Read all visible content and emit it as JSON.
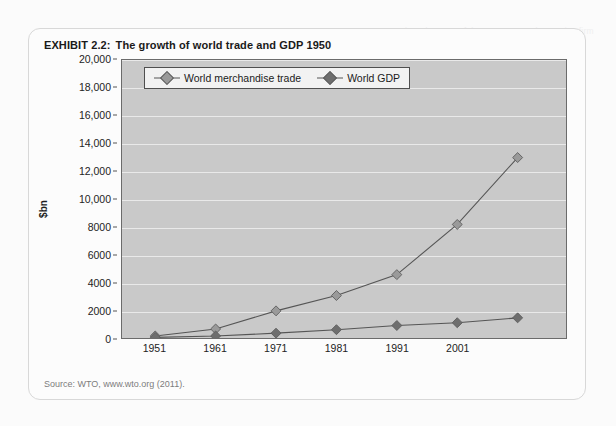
{
  "exhibit": {
    "label": "EXHIBIT 2.2:",
    "title": "The growth of world trade and GDP 1950",
    "source": "Source: WTO, www.wto.org (2011)."
  },
  "bleed_text": "EXHIBIT 2.1  The relevance of the customer to the service firm",
  "colors": {
    "plot_background": "#c9c9c9",
    "plot_border": "#6b6b6b",
    "gridline": "#e9e9e9",
    "trade_series": "#8f8f8f",
    "gdp_series": "#6e6e6e",
    "legend_background": "#f2f2f2",
    "card_border": "#d8d8d8"
  },
  "legend": {
    "position": "top-left-inside-plot",
    "items": [
      {
        "label": "World merchandise trade",
        "marker": "diamond-light",
        "color": "#9a9a9a"
      },
      {
        "label": "World GDP",
        "marker": "diamond-dark",
        "color": "#6e6e6e"
      }
    ]
  },
  "chart_data": {
    "type": "line",
    "title": "The growth of world trade and GDP 1950",
    "xlabel": "",
    "ylabel": "$bn",
    "ylim": [
      0,
      20000
    ],
    "ytick_step": 2000,
    "yticks": [
      "0",
      "2000",
      "4000",
      "6000",
      "8000",
      "10,000",
      "12,000",
      "14,000",
      "16,000",
      "18,000",
      "20,000"
    ],
    "ytick_values": [
      0,
      2000,
      4000,
      6000,
      8000,
      10000,
      12000,
      14000,
      16000,
      18000,
      20000
    ],
    "grid": true,
    "x": [
      1951,
      1961,
      1971,
      1981,
      1991,
      2001,
      2011
    ],
    "xtick_labels": [
      "1951",
      "1961",
      "1971",
      "1981",
      "1991",
      "2001"
    ],
    "xtick_values": [
      1951,
      1961,
      1971,
      1981,
      1991,
      2001
    ],
    "legend_position": "upper left",
    "series": [
      {
        "name": "World merchandise trade",
        "color": "#9a9a9a",
        "marker": "diamond",
        "values": [
          200,
          700,
          2000,
          3100,
          4600,
          8200,
          13000
        ]
      },
      {
        "name": "World GDP",
        "color": "#6e6e6e",
        "marker": "diamond",
        "values": [
          100,
          200,
          400,
          650,
          950,
          1150,
          1500
        ]
      }
    ],
    "source": "Source: WTO, www.wto.org (2011)."
  }
}
